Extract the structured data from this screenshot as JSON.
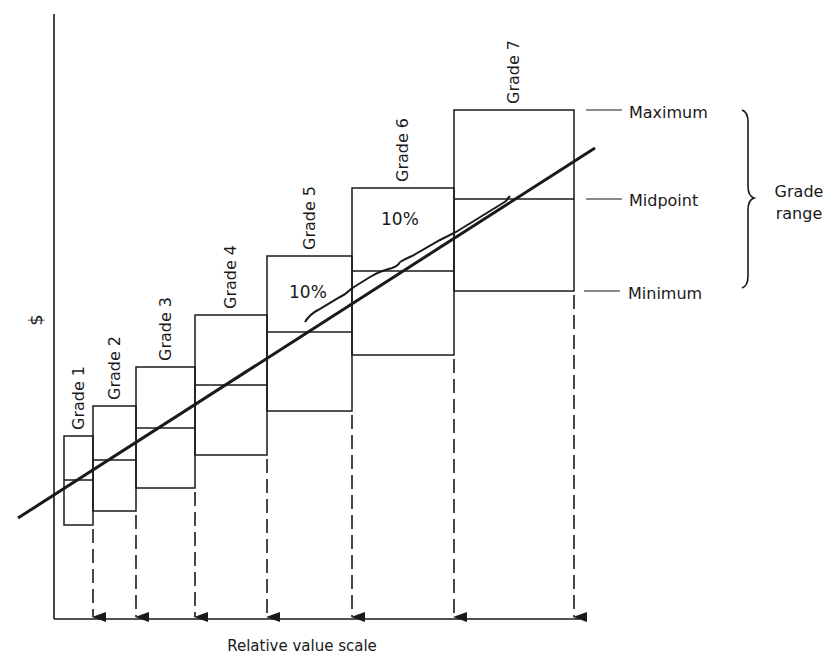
{
  "diagram": {
    "title": "",
    "y_axis_label": "$",
    "x_axis_label": "Relative value scale",
    "grades": [
      {
        "label": "Grade 1",
        "x0": 64,
        "x1": 93,
        "max": 436,
        "mid": 480,
        "min": 525
      },
      {
        "label": "Grade 2",
        "x0": 93,
        "x1": 136,
        "max": 406,
        "mid": 460,
        "min": 511
      },
      {
        "label": "Grade 3",
        "x0": 136,
        "x1": 195,
        "max": 367,
        "mid": 428,
        "min": 488
      },
      {
        "label": "Grade 4",
        "x0": 195,
        "x1": 267,
        "max": 315,
        "mid": 385,
        "min": 455
      },
      {
        "label": "Grade 5",
        "x0": 267,
        "x1": 352,
        "max": 256,
        "mid": 332,
        "min": 411
      },
      {
        "label": "Grade 6",
        "x0": 352,
        "x1": 454,
        "max": 188,
        "mid": 271,
        "min": 355
      },
      {
        "label": "Grade 7",
        "x0": 454,
        "x1": 574,
        "max": 110,
        "mid": 199,
        "min": 291
      }
    ],
    "legend": {
      "maximum": "Maximum",
      "midpoint": "Midpoint",
      "minimum": "Minimum",
      "range_line1": "Grade",
      "range_line2": "range"
    },
    "annotations": [
      {
        "text": "10%",
        "x": 289,
        "y": 298
      },
      {
        "text": "10%",
        "x": 381,
        "y": 225
      }
    ],
    "trend_line": {
      "x1": 18,
      "y1": 518,
      "x2": 595,
      "y2": 148
    },
    "arrow_positions": [
      93,
      136,
      195,
      267,
      352,
      454,
      574
    ]
  },
  "colors": {
    "ink": "#1a1a1a",
    "background": "#ffffff"
  }
}
